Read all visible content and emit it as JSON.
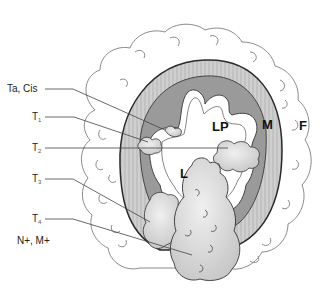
{
  "diagram": {
    "type": "bladder-cancer-tnm-staging-cross-section",
    "stage_labels": [
      {
        "id": "ta-cis",
        "text": "Ta, Cis",
        "sub": ""
      },
      {
        "id": "t1",
        "text": "T",
        "sub": "1"
      },
      {
        "id": "t2",
        "text": "T",
        "sub": "2"
      },
      {
        "id": "t3",
        "text": "T",
        "sub": "3"
      },
      {
        "id": "t4",
        "text": "T",
        "sub": "4"
      },
      {
        "id": "n-m",
        "text": "N+, M+",
        "sub": ""
      }
    ],
    "region_labels": {
      "lumen_lamina_propria": "LP",
      "muscle": "M",
      "fat": "F",
      "lumen": "L"
    },
    "colors": {
      "outer_muscle_layer": "#c8c8c8",
      "inner_muscle_layer": "#9a9a9a",
      "mucosa": "#ffffff",
      "tumor_fill": "#d9d9d9",
      "outline": "#333333",
      "fat_outline": "#8a8a8a",
      "leader_line": "#444444"
    }
  }
}
